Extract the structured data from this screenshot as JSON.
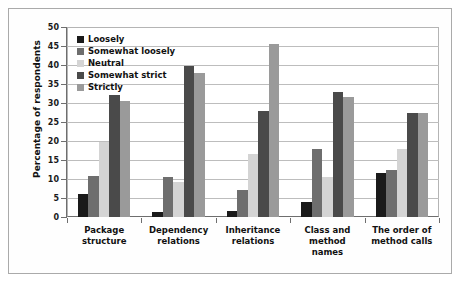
{
  "chart_data": {
    "type": "bar",
    "title": "",
    "xlabel": "",
    "ylabel": "Percentage of respondents",
    "ylim": [
      0,
      50
    ],
    "ytick_step": 5,
    "yticks": [
      0,
      5,
      10,
      15,
      20,
      25,
      30,
      35,
      40,
      45,
      50
    ],
    "grid": true,
    "legend_position": "upper-left-inside",
    "categories": [
      "Package structure",
      "Dependency relations",
      "Inheritance relations",
      "Class and method names",
      "The order of method calls"
    ],
    "category_lines": [
      [
        "Package",
        "structure"
      ],
      [
        "Dependency",
        "relations"
      ],
      [
        "Inheritance",
        "relations"
      ],
      [
        "Class and",
        "method",
        "names"
      ],
      [
        "The order of",
        "method calls"
      ]
    ],
    "series": [
      {
        "name": "Loosely",
        "color": "#1a1a1a",
        "values": [
          6.0,
          1.3,
          1.5,
          4.0,
          11.5
        ]
      },
      {
        "name": "Somewhat loosely",
        "color": "#6e6e6e",
        "values": [
          10.7,
          10.5,
          7.0,
          18.0,
          12.5
        ]
      },
      {
        "name": "Neutral",
        "color": "#d4d4d4",
        "values": [
          19.8,
          9.2,
          16.5,
          10.5,
          18.0
        ]
      },
      {
        "name": "Somewhat strict",
        "color": "#4a4a4a",
        "values": [
          32.2,
          39.8,
          27.8,
          33.0,
          27.5
        ]
      },
      {
        "name": "Strictly",
        "color": "#9a9a9a",
        "values": [
          30.5,
          38.0,
          45.5,
          31.5,
          27.5
        ]
      }
    ]
  }
}
